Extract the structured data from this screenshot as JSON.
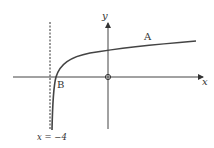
{
  "diagram": {
    "type": "graph of logarithmic function",
    "axes": {
      "x_label": "x",
      "y_label": "y",
      "origin_label": "O"
    },
    "asymptote": {
      "label": "x = −4",
      "style": "dashed"
    },
    "points": [
      {
        "label": "A",
        "description": "point on curve"
      },
      {
        "label": "B",
        "description": "x-intercept of curve"
      }
    ],
    "colors": {
      "line": "#333333",
      "background": "#ffffff"
    }
  }
}
